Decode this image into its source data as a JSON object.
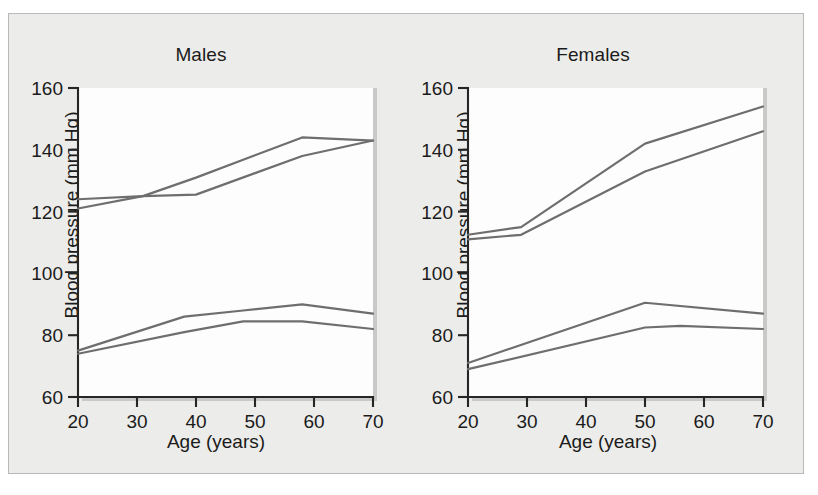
{
  "figure": {
    "background_color": "#ececea",
    "border_color": "#b9b9b7",
    "line_color": "#6e6e6e",
    "axis_color": "#262626",
    "plot_background": "#fdfdfd"
  },
  "panels": [
    {
      "title": "Males"
    },
    {
      "title": "Females"
    }
  ],
  "axes": {
    "xlabel": "Age (years)",
    "ylabel": "Blood pressure (mm Hg)",
    "xticks": [
      "20",
      "30",
      "40",
      "50",
      "60",
      "70"
    ],
    "yticks": [
      "60",
      "80",
      "100",
      "120",
      "140",
      "160"
    ]
  },
  "chart_data": [
    {
      "type": "line",
      "title": "Males",
      "xlabel": "Age (years)",
      "ylabel": "Blood pressure (mm Hg)",
      "xlim": [
        20,
        70
      ],
      "ylim": [
        60,
        160
      ],
      "xticks": [
        20,
        30,
        40,
        50,
        60,
        70
      ],
      "yticks": [
        60,
        80,
        100,
        120,
        140,
        160
      ],
      "grid": false,
      "legend": "none",
      "series": [
        {
          "name": "systolic-upper",
          "x": [
            20,
            31,
            40,
            58,
            70
          ],
          "values": [
            124,
            125,
            125.5,
            138,
            143
          ]
        },
        {
          "name": "systolic-lower",
          "x": [
            20,
            31,
            40,
            58,
            70
          ],
          "values": [
            121,
            125,
            131,
            144,
            143
          ]
        },
        {
          "name": "diastolic-upper",
          "x": [
            20,
            38,
            48,
            58,
            70
          ],
          "values": [
            75,
            86,
            88,
            90,
            87
          ]
        },
        {
          "name": "diastolic-lower",
          "x": [
            20,
            38,
            48,
            58,
            70
          ],
          "values": [
            74,
            81,
            84.5,
            84.5,
            82
          ]
        }
      ]
    },
    {
      "type": "line",
      "title": "Females",
      "xlabel": "Age (years)",
      "ylabel": "Blood pressure (mm Hg)",
      "xlim": [
        20,
        70
      ],
      "ylim": [
        60,
        160
      ],
      "xticks": [
        20,
        30,
        40,
        50,
        60,
        70
      ],
      "yticks": [
        60,
        80,
        100,
        120,
        140,
        160
      ],
      "grid": false,
      "legend": "none",
      "series": [
        {
          "name": "systolic-upper",
          "x": [
            20,
            29,
            50,
            70
          ],
          "values": [
            112.5,
            115,
            142,
            154
          ]
        },
        {
          "name": "systolic-lower",
          "x": [
            20,
            29,
            50,
            70
          ],
          "values": [
            111,
            112.5,
            133,
            146
          ]
        },
        {
          "name": "diastolic-upper",
          "x": [
            20,
            50,
            70
          ],
          "values": [
            71,
            90.5,
            87
          ]
        },
        {
          "name": "diastolic-lower",
          "x": [
            20,
            50,
            56,
            70
          ],
          "values": [
            69,
            82.5,
            83,
            82
          ]
        }
      ]
    }
  ]
}
